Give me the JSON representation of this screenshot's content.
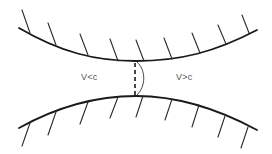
{
  "diagram": {
    "type": "converging-diverging nozzle (throat)",
    "labels": {
      "left_region": "V<c",
      "right_region": "V>c"
    },
    "colors": {
      "background": "#ffffff",
      "line": "#1a1a1a",
      "text": "#555555"
    },
    "elements": {
      "top_wall": "curved upper wall with hatching",
      "bottom_wall": "curved lower wall with hatching",
      "throat": "dashed vertical line with curved arc at narrowest section"
    }
  }
}
